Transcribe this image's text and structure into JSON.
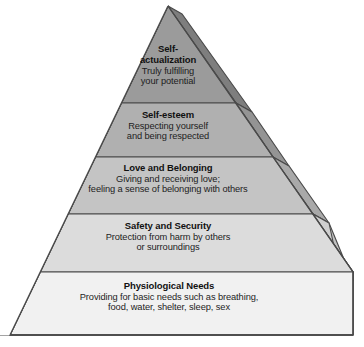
{
  "diagram": {
    "name": "Maslow's Hierarchy of Needs pyramid",
    "type": "pyramid",
    "orientation": "apex-top",
    "tier_count": 5,
    "colors": {
      "tier_1_fill": "#9b9b9b",
      "tier_2_fill": "#b0b0b0",
      "tier_3_fill": "#c4c4c4",
      "tier_4_fill": "#dcdcdc",
      "tier_5_fill": "#f1f1f1",
      "side_1_fill": "#7e7e7e",
      "side_2_fill": "#949494",
      "side_3_fill": "#a9a9a9",
      "side_4_fill": "#c2c2c2",
      "side_5_fill": "#d9d9d9",
      "outline": "#4a4a4a",
      "text": "#111111",
      "background": "#ffffff"
    },
    "tiers": [
      {
        "index": 1,
        "position": "top",
        "title": "Self-­actualization",
        "title_line1": "Self-",
        "title_line2": "actualization",
        "desc_line1": "Truly fulfilling",
        "desc_line2": "your potential",
        "fill": "#9b9b9b"
      },
      {
        "index": 2,
        "position": "second",
        "title": "Self-esteem",
        "desc_line1": "Respecting yourself",
        "desc_line2": "and being respected",
        "fill": "#b0b0b0"
      },
      {
        "index": 3,
        "position": "middle",
        "title": "Love and Belonging",
        "desc_line1": "Giving and receiving love;",
        "desc_line2": "feeling a sense of belonging with others",
        "fill": "#c4c4c4"
      },
      {
        "index": 4,
        "position": "fourth",
        "title": "Safety and Security",
        "desc_line1": "Protection from harm by others",
        "desc_line2": "or surroundings",
        "fill": "#dcdcdc"
      },
      {
        "index": 5,
        "position": "base",
        "title": "Physiological Needs",
        "desc_line1": "Providing for basic needs such as breathing,",
        "desc_line2": "food, water, shelter, sleep, sex",
        "fill": "#f1f1f1"
      }
    ]
  }
}
